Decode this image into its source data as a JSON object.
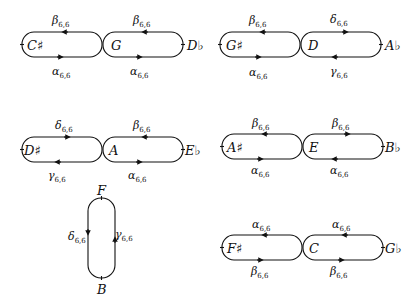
{
  "diagrams": [
    {
      "id": "d1",
      "left_node": "C♯",
      "center_node": "G",
      "right_node": "D♭",
      "left_top": {
        "sym": "β",
        "sub": "6,6"
      },
      "left_bottom": {
        "sym": "α",
        "sub": "6,6"
      },
      "right_top": {
        "sym": "β",
        "sub": "6,6"
      },
      "right_bottom": {
        "sym": "α",
        "sub": "6,6"
      }
    },
    {
      "id": "d2",
      "left_node": "G♯",
      "center_node": "D",
      "right_node": "A♭",
      "left_top": {
        "sym": "β",
        "sub": "6,6"
      },
      "left_bottom": {
        "sym": "α",
        "sub": "6,6"
      },
      "right_top": {
        "sym": "δ",
        "sub": "6,6"
      },
      "right_bottom": {
        "sym": "γ",
        "sub": "6,6"
      }
    },
    {
      "id": "d3",
      "left_node": "D♯",
      "center_node": "A",
      "right_node": "E♭",
      "left_top": {
        "sym": "δ",
        "sub": "6,6"
      },
      "left_bottom": {
        "sym": "γ",
        "sub": "6,6"
      },
      "right_top": {
        "sym": "β",
        "sub": "6,6"
      },
      "right_bottom": {
        "sym": "α",
        "sub": "6,6"
      }
    },
    {
      "id": "d4",
      "left_node": "A♯",
      "center_node": "E",
      "right_node": "B♭",
      "left_top": {
        "sym": "β",
        "sub": "6,6"
      },
      "left_bottom": {
        "sym": "α",
        "sub": "6,6"
      },
      "right_top": {
        "sym": "β",
        "sub": "6,6"
      },
      "right_bottom": {
        "sym": "α",
        "sub": "6,6"
      }
    },
    {
      "id": "d5",
      "top_node": "F",
      "bottom_node": "B",
      "left_side": {
        "sym": "δ",
        "sub": "6,6"
      },
      "right_side": {
        "sym": "γ",
        "sub": "6,6"
      }
    },
    {
      "id": "d6",
      "left_node": "F♯",
      "center_node": "C",
      "right_node": "G♭",
      "left_top": {
        "sym": "α",
        "sub": "6,6"
      },
      "left_bottom": {
        "sym": "β",
        "sub": "6,6"
      },
      "right_top": {
        "sym": "α",
        "sub": "6,6"
      },
      "right_bottom": {
        "sym": "β",
        "sub": "6,6"
      }
    }
  ]
}
